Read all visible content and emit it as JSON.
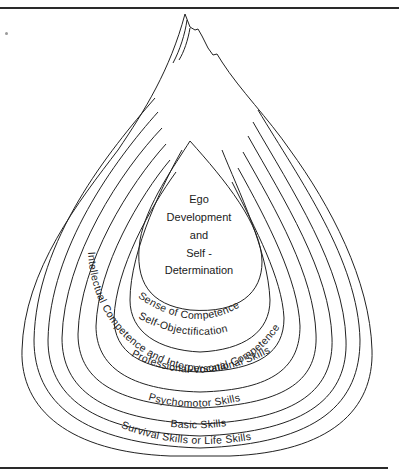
{
  "figure": {
    "core": {
      "lines": [
        "Ego",
        "Development",
        "and",
        "Self -",
        "Determination"
      ]
    },
    "layers": [
      {
        "label": "Sense of Competence"
      },
      {
        "label": "Self-Objectification"
      },
      {
        "label": "Intellectual Competence and Interpersonal Competence"
      },
      {
        "label": "Professional-Vocational Skills"
      },
      {
        "label": "Psychomotor Skills"
      },
      {
        "label": "Basic Skills"
      },
      {
        "label": "Survival Skills or Life Skills"
      }
    ],
    "colors": {
      "ink": "#222222",
      "background": "#ffffff"
    }
  }
}
